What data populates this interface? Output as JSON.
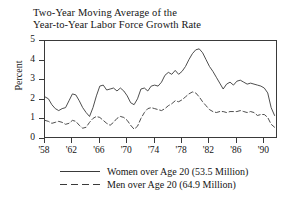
{
  "chart_data": {
    "type": "line",
    "title": "Two-Year Moving Average of the\nYear-to-Year Labor Force Growth Rate",
    "xlabel": "",
    "ylabel": "Percent",
    "ylim": [
      0,
      5
    ],
    "xlim": [
      1958,
      1992
    ],
    "grid": false,
    "legend_position": "below-axes",
    "ytick_labels": [
      "0",
      "1",
      "2",
      "3",
      "4",
      "5"
    ],
    "ytick_values": [
      0,
      1,
      2,
      3,
      4,
      5
    ],
    "xtick_labels": [
      "'58",
      "'62",
      "'66",
      "'70",
      "'74",
      "'78",
      "'82",
      "'86",
      "'90"
    ],
    "xtick_values": [
      1958,
      1962,
      1966,
      1970,
      1974,
      1978,
      1982,
      1986,
      1990
    ],
    "series": [
      {
        "name": "Women over Age 20 (53.5 Million)",
        "style": "solid",
        "color": "#3a3a3a",
        "x": [
          1958.0,
          1958.5,
          1959.0,
          1959.5,
          1960.0,
          1960.5,
          1961.0,
          1961.5,
          1962.0,
          1962.5,
          1963.0,
          1963.5,
          1964.0,
          1964.5,
          1965.0,
          1965.5,
          1966.0,
          1966.5,
          1967.0,
          1967.5,
          1968.0,
          1968.5,
          1969.0,
          1969.5,
          1970.0,
          1970.5,
          1971.0,
          1971.5,
          1972.0,
          1972.5,
          1973.0,
          1973.5,
          1974.0,
          1974.5,
          1975.0,
          1975.5,
          1976.0,
          1976.5,
          1977.0,
          1977.5,
          1978.0,
          1978.5,
          1979.0,
          1979.5,
          1980.0,
          1980.5,
          1981.0,
          1981.5,
          1982.0,
          1982.5,
          1983.0,
          1983.5,
          1984.0,
          1984.5,
          1985.0,
          1985.5,
          1986.0,
          1986.5,
          1987.0,
          1987.5,
          1988.0,
          1988.5,
          1989.0,
          1989.5,
          1990.0,
          1990.5,
          1991.0,
          1991.5
        ],
        "y": [
          2.15,
          2.05,
          1.75,
          1.55,
          1.45,
          1.55,
          1.6,
          1.95,
          2.3,
          2.25,
          1.95,
          1.6,
          1.35,
          1.15,
          1.6,
          2.2,
          2.7,
          2.75,
          2.5,
          2.55,
          2.6,
          2.45,
          2.6,
          2.45,
          2.2,
          1.85,
          1.75,
          2.05,
          2.55,
          2.6,
          2.45,
          2.7,
          2.75,
          2.7,
          2.9,
          3.25,
          3.4,
          3.3,
          3.5,
          3.3,
          3.45,
          3.7,
          4.05,
          4.35,
          4.55,
          4.6,
          4.4,
          4.05,
          3.7,
          3.45,
          3.15,
          2.85,
          2.55,
          2.8,
          2.9,
          2.75,
          2.95,
          3.0,
          2.9,
          2.8,
          2.85,
          2.8,
          2.75,
          2.7,
          2.6,
          2.35,
          1.6,
          1.2
        ]
      },
      {
        "name": "Men over Age 20 (64.9 Million)",
        "style": "dashed",
        "color": "#3a3a3a",
        "x": [
          1958.0,
          1958.5,
          1959.0,
          1959.5,
          1960.0,
          1960.5,
          1961.0,
          1961.5,
          1962.0,
          1962.5,
          1963.0,
          1963.5,
          1964.0,
          1964.5,
          1965.0,
          1965.5,
          1966.0,
          1966.5,
          1967.0,
          1967.5,
          1968.0,
          1968.5,
          1969.0,
          1969.5,
          1970.0,
          1970.5,
          1971.0,
          1971.5,
          1972.0,
          1972.5,
          1973.0,
          1973.5,
          1974.0,
          1974.5,
          1975.0,
          1975.5,
          1976.0,
          1976.5,
          1977.0,
          1977.5,
          1978.0,
          1978.5,
          1979.0,
          1979.5,
          1980.0,
          1980.5,
          1981.0,
          1981.5,
          1982.0,
          1982.5,
          1983.0,
          1983.5,
          1984.0,
          1984.5,
          1985.0,
          1985.5,
          1986.0,
          1986.5,
          1987.0,
          1987.5,
          1988.0,
          1988.5,
          1989.0,
          1989.5,
          1990.0,
          1990.5,
          1991.0,
          1991.5
        ],
        "y": [
          0.95,
          0.9,
          0.8,
          0.85,
          0.9,
          0.85,
          0.75,
          0.8,
          0.95,
          0.9,
          0.7,
          0.55,
          0.6,
          0.85,
          1.05,
          1.15,
          1.1,
          0.95,
          0.8,
          0.7,
          0.85,
          1.05,
          1.15,
          1.1,
          0.95,
          0.7,
          0.5,
          0.65,
          1.05,
          1.35,
          1.55,
          1.6,
          1.55,
          1.5,
          1.45,
          1.55,
          1.7,
          1.8,
          1.95,
          1.9,
          2.0,
          2.15,
          2.3,
          2.4,
          2.35,
          2.15,
          1.9,
          1.7,
          1.5,
          1.4,
          1.35,
          1.4,
          1.4,
          1.35,
          1.4,
          1.4,
          1.4,
          1.45,
          1.4,
          1.35,
          1.4,
          1.35,
          1.2,
          1.25,
          1.25,
          1.1,
          0.75,
          0.6
        ]
      }
    ]
  },
  "legend": {
    "items": [
      {
        "label": "Women over Age 20 (53.5 Million)",
        "style": "solid"
      },
      {
        "label": "Men over Age 20 (64.9 Million)",
        "style": "dashed"
      }
    ]
  }
}
